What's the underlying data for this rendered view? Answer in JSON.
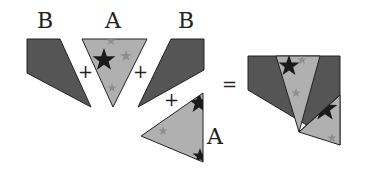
{
  "labels": {
    "b_left": "B",
    "a_top": "A",
    "b_right": "B",
    "a_bottom": "A"
  },
  "operators": {
    "plus_1": "+",
    "plus_2": "+",
    "plus_3": "+",
    "equals": "="
  },
  "colors": {
    "dark_piece": "#555555",
    "light_piece": "#b0b0b0",
    "star": "#1a1a1a",
    "faint_star": "#8e8e8e",
    "outline": "#222222"
  }
}
